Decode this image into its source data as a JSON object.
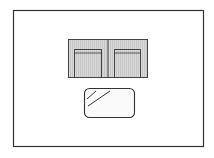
{
  "diagram": {
    "type": "furniture-floor-plan",
    "title": "Room layout with two-seat sofa and coffee table",
    "colors": {
      "background": "#ffffff",
      "outline": "#333333",
      "upholstery_fill": "#d9d9d9",
      "upholstery_stripe": "#c4c4c4",
      "table_fill": "#fafafa"
    },
    "room": {
      "label": "Room boundary",
      "x": 13,
      "y": 10,
      "width": 191,
      "height": 137
    },
    "sofa": {
      "label": "Two-seat sofa",
      "x": 68,
      "y": 39,
      "width": 80,
      "height": 38,
      "seats": [
        {
          "label": "Left seat cushion",
          "x": 74,
          "y": 49,
          "width": 28,
          "height": 28
        },
        {
          "label": "Right seat cushion",
          "x": 114,
          "y": 49,
          "width": 27,
          "height": 28
        }
      ],
      "divider_x": 108
    },
    "coffee_table": {
      "label": "Glass coffee table",
      "x": 84,
      "y": 88,
      "width": 51,
      "height": 29,
      "corner_radius": 5
    }
  }
}
